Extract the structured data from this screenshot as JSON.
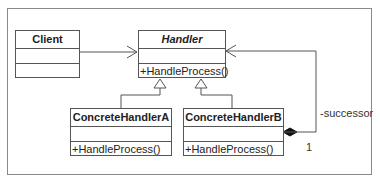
{
  "classes": {
    "client": {
      "name": "Client",
      "operation": ""
    },
    "handler": {
      "name": "Handler",
      "operation": "+HandleProcess()"
    },
    "concrete_a": {
      "name": "ConcreteHandlerA",
      "operation": "+HandleProcess()"
    },
    "concrete_b": {
      "name": "ConcreteHandlerB",
      "operation": "+HandleProcess()"
    }
  },
  "relations": {
    "successor_role": "-successor",
    "successor_multiplicity": "1"
  },
  "colors": {
    "line": "#555555",
    "frame": "#8a8a8a"
  }
}
